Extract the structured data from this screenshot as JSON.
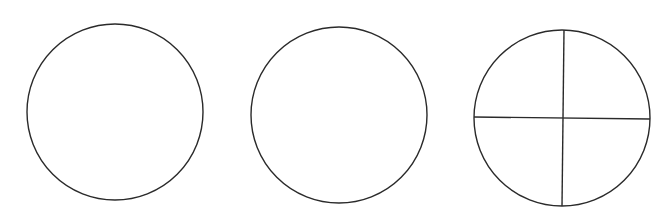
{
  "canvas": {
    "width": 672,
    "height": 220,
    "background": "#ffffff"
  },
  "stroke": {
    "color": "#2a2a2a",
    "width": 1.4
  },
  "shapes": [
    {
      "type": "circle",
      "label": "plain-circle-1",
      "cx": 115,
      "cy": 112,
      "r": 88,
      "divided": false
    },
    {
      "type": "circle",
      "label": "plain-circle-2",
      "cx": 339,
      "cy": 115,
      "r": 88,
      "divided": false
    },
    {
      "type": "circle",
      "label": "quartered-circle",
      "cx": 562,
      "cy": 118,
      "r": 88,
      "divided": true,
      "lines": [
        {
          "name": "vertical-divider",
          "x1": 564,
          "y1": 30,
          "x2": 562,
          "y2": 206
        },
        {
          "name": "horizontal-divider",
          "x1": 474,
          "y1": 117,
          "x2": 650,
          "y2": 119
        }
      ]
    }
  ]
}
